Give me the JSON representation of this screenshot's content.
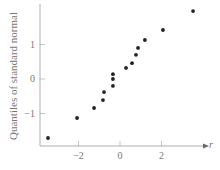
{
  "chart_data": {
    "type": "scatter",
    "title": "",
    "xlabel": "r",
    "ylabel": "Quantiles of standard normal",
    "xlim": [
      -4,
      4
    ],
    "ylim": [
      -2,
      2.1
    ],
    "xticks": [
      -2,
      0,
      2
    ],
    "xtick_labels": [
      "−2",
      "0",
      "2"
    ],
    "yticks": [
      -1,
      0,
      1
    ],
    "ytick_labels": [
      "−1",
      "0",
      "1"
    ],
    "grid": false,
    "legend": null,
    "series": [
      {
        "name": "normal probability plot",
        "color": "#222222",
        "points": [
          {
            "x": -3.47,
            "y": -1.71
          },
          {
            "x": -2.07,
            "y": -1.13
          },
          {
            "x": -1.25,
            "y": -0.84
          },
          {
            "x": -0.82,
            "y": -0.61
          },
          {
            "x": -0.77,
            "y": -0.38
          },
          {
            "x": -0.34,
            "y": -0.2
          },
          {
            "x": -0.34,
            "y": 0.0
          },
          {
            "x": -0.34,
            "y": 0.14
          },
          {
            "x": 0.29,
            "y": 0.32
          },
          {
            "x": 0.58,
            "y": 0.46
          },
          {
            "x": 0.77,
            "y": 0.7
          },
          {
            "x": 0.87,
            "y": 0.9
          },
          {
            "x": 1.2,
            "y": 1.13
          },
          {
            "x": 2.07,
            "y": 1.42
          },
          {
            "x": 3.52,
            "y": 1.97
          }
        ]
      }
    ]
  },
  "axes": {
    "x_axis_label": "r",
    "y_axis_label": "Quantiles of standard normal"
  }
}
